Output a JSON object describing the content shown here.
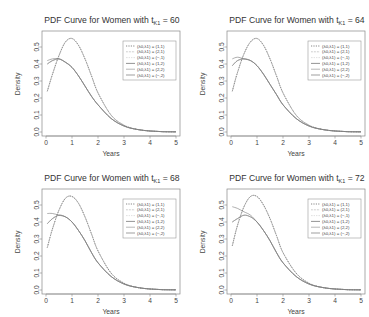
{
  "figure": {
    "panel_titles_prefix": "PDF Curve for Women with t",
    "panel_titles_subscript": "K1",
    "xlabel": "Years",
    "ylabel": "Density",
    "x_ticks": [
      "0",
      "1",
      "2",
      "3",
      "4",
      "5"
    ],
    "y_ticks": [
      "0.0",
      "0.1",
      "0.2",
      "0.3",
      "0.4",
      "0.5"
    ],
    "legend": [
      "(λ0,λ1) = (1,1)",
      "(λ0,λ1) = (2,1)",
      "(λ0,λ1) = (−,1)",
      "(λ0,λ1) = (1,2)",
      "(λ0,λ1) = (2,2)",
      "(λ0,λ1) = (−,2)"
    ]
  },
  "chart_data": [
    {
      "type": "line",
      "title": "PDF Curve for Women with tK1 = 60",
      "t_value": "60",
      "xlabel": "Years",
      "ylabel": "Density",
      "xlim": [
        0,
        5
      ],
      "ylim": [
        0,
        0.57
      ],
      "legend_position": "top-right",
      "x": [
        0.05,
        0.25,
        0.5,
        0.75,
        1.0,
        1.25,
        1.5,
        1.75,
        2.0,
        2.5,
        3.0,
        3.5,
        4.0,
        4.5,
        5.0
      ],
      "series": [
        {
          "name": "(λ0,λ1) = (1,1)",
          "values": [
            0.24,
            0.34,
            0.45,
            0.53,
            0.55,
            0.51,
            0.43,
            0.33,
            0.23,
            0.1,
            0.04,
            0.015,
            0.006,
            0.002,
            0.001
          ]
        },
        {
          "name": "(λ0,λ1) = (2,1)",
          "values": [
            0.24,
            0.34,
            0.45,
            0.53,
            0.55,
            0.51,
            0.43,
            0.33,
            0.23,
            0.1,
            0.04,
            0.015,
            0.006,
            0.002,
            0.001
          ]
        },
        {
          "name": "(λ0,λ1) = (−,1)",
          "values": [
            0.24,
            0.34,
            0.45,
            0.53,
            0.55,
            0.51,
            0.43,
            0.33,
            0.23,
            0.1,
            0.04,
            0.015,
            0.006,
            0.002,
            0.001
          ]
        },
        {
          "name": "(λ0,λ1) = (1,2)",
          "values": [
            0.4,
            0.42,
            0.43,
            0.41,
            0.38,
            0.33,
            0.27,
            0.21,
            0.16,
            0.08,
            0.035,
            0.015,
            0.006,
            0.002,
            0.001
          ]
        },
        {
          "name": "(λ0,λ1) = (2,2)",
          "values": [
            0.4,
            0.42,
            0.43,
            0.41,
            0.38,
            0.33,
            0.27,
            0.21,
            0.16,
            0.08,
            0.035,
            0.015,
            0.006,
            0.002,
            0.001
          ]
        },
        {
          "name": "(λ0,λ1) = (−,2)",
          "values": [
            0.42,
            0.43,
            0.43,
            0.41,
            0.38,
            0.33,
            0.27,
            0.21,
            0.16,
            0.08,
            0.035,
            0.015,
            0.006,
            0.002,
            0.001
          ]
        }
      ]
    },
    {
      "type": "line",
      "title": "PDF Curve for Women with tK1 = 64",
      "t_value": "64",
      "xlabel": "Years",
      "ylabel": "Density",
      "xlim": [
        0,
        5
      ],
      "ylim": [
        0,
        0.57
      ],
      "legend_position": "top-right",
      "x": [
        0.05,
        0.25,
        0.5,
        0.75,
        1.0,
        1.25,
        1.5,
        1.75,
        2.0,
        2.5,
        3.0,
        3.5,
        4.0,
        4.5,
        5.0
      ],
      "series": [
        {
          "name": "(λ0,λ1) = (1,1)",
          "values": [
            0.24,
            0.35,
            0.46,
            0.53,
            0.55,
            0.51,
            0.43,
            0.33,
            0.23,
            0.1,
            0.04,
            0.015,
            0.006,
            0.002,
            0.001
          ]
        },
        {
          "name": "(λ0,λ1) = (2,1)",
          "values": [
            0.24,
            0.35,
            0.46,
            0.53,
            0.55,
            0.51,
            0.43,
            0.33,
            0.23,
            0.1,
            0.04,
            0.015,
            0.006,
            0.002,
            0.001
          ]
        },
        {
          "name": "(λ0,λ1) = (−,1)",
          "values": [
            0.24,
            0.35,
            0.46,
            0.53,
            0.55,
            0.51,
            0.43,
            0.33,
            0.23,
            0.1,
            0.04,
            0.015,
            0.006,
            0.002,
            0.001
          ]
        },
        {
          "name": "(λ0,λ1) = (1,2)",
          "values": [
            0.39,
            0.42,
            0.43,
            0.42,
            0.39,
            0.34,
            0.28,
            0.22,
            0.16,
            0.08,
            0.035,
            0.015,
            0.006,
            0.002,
            0.001
          ]
        },
        {
          "name": "(λ0,λ1) = (2,2)",
          "values": [
            0.39,
            0.42,
            0.43,
            0.42,
            0.39,
            0.34,
            0.28,
            0.22,
            0.16,
            0.08,
            0.035,
            0.015,
            0.006,
            0.002,
            0.001
          ]
        },
        {
          "name": "(λ0,λ1) = (−,2)",
          "values": [
            0.43,
            0.44,
            0.43,
            0.42,
            0.39,
            0.34,
            0.28,
            0.22,
            0.16,
            0.08,
            0.035,
            0.015,
            0.006,
            0.002,
            0.001
          ]
        }
      ]
    },
    {
      "type": "line",
      "title": "PDF Curve for Women with tK1 = 68",
      "t_value": "68",
      "xlabel": "Years",
      "ylabel": "Density",
      "xlim": [
        0,
        5
      ],
      "ylim": [
        0,
        0.57
      ],
      "legend_position": "top-right",
      "x": [
        0.05,
        0.25,
        0.5,
        0.75,
        1.0,
        1.25,
        1.5,
        1.75,
        2.0,
        2.5,
        3.0,
        3.5,
        4.0,
        4.5,
        5.0
      ],
      "series": [
        {
          "name": "(λ0,λ1) = (1,1)",
          "values": [
            0.25,
            0.36,
            0.47,
            0.54,
            0.55,
            0.51,
            0.43,
            0.33,
            0.23,
            0.1,
            0.04,
            0.015,
            0.006,
            0.002,
            0.001
          ]
        },
        {
          "name": "(λ0,λ1) = (2,1)",
          "values": [
            0.25,
            0.36,
            0.47,
            0.54,
            0.55,
            0.51,
            0.43,
            0.33,
            0.23,
            0.1,
            0.04,
            0.015,
            0.006,
            0.002,
            0.001
          ]
        },
        {
          "name": "(λ0,λ1) = (−,1)",
          "values": [
            0.25,
            0.36,
            0.47,
            0.54,
            0.55,
            0.51,
            0.43,
            0.33,
            0.23,
            0.1,
            0.04,
            0.015,
            0.006,
            0.002,
            0.001
          ]
        },
        {
          "name": "(λ0,λ1) = (1,2)",
          "values": [
            0.39,
            0.42,
            0.44,
            0.43,
            0.4,
            0.35,
            0.29,
            0.22,
            0.16,
            0.08,
            0.035,
            0.015,
            0.006,
            0.002,
            0.001
          ]
        },
        {
          "name": "(λ0,λ1) = (2,2)",
          "values": [
            0.39,
            0.42,
            0.44,
            0.43,
            0.4,
            0.35,
            0.29,
            0.22,
            0.16,
            0.08,
            0.035,
            0.015,
            0.006,
            0.002,
            0.001
          ]
        },
        {
          "name": "(λ0,λ1) = (−,2)",
          "values": [
            0.45,
            0.45,
            0.44,
            0.43,
            0.4,
            0.35,
            0.29,
            0.22,
            0.16,
            0.08,
            0.035,
            0.015,
            0.006,
            0.002,
            0.001
          ]
        }
      ]
    },
    {
      "type": "line",
      "title": "PDF Curve for Women with tK1 = 72",
      "t_value": "72",
      "xlabel": "Years",
      "ylabel": "Density",
      "xlim": [
        0,
        5
      ],
      "ylim": [
        0,
        0.57
      ],
      "legend_position": "top-right",
      "x": [
        0.05,
        0.25,
        0.5,
        0.75,
        1.0,
        1.25,
        1.5,
        1.75,
        2.0,
        2.5,
        3.0,
        3.5,
        4.0,
        4.5,
        5.0
      ],
      "series": [
        {
          "name": "(λ0,λ1) = (1,1)",
          "values": [
            0.26,
            0.38,
            0.49,
            0.55,
            0.55,
            0.5,
            0.42,
            0.32,
            0.22,
            0.1,
            0.04,
            0.015,
            0.006,
            0.002,
            0.001
          ]
        },
        {
          "name": "(λ0,λ1) = (2,1)",
          "values": [
            0.26,
            0.38,
            0.49,
            0.55,
            0.55,
            0.5,
            0.42,
            0.32,
            0.22,
            0.1,
            0.04,
            0.015,
            0.006,
            0.002,
            0.001
          ]
        },
        {
          "name": "(λ0,λ1) = (−,1)",
          "values": [
            0.26,
            0.38,
            0.49,
            0.55,
            0.55,
            0.5,
            0.42,
            0.32,
            0.22,
            0.1,
            0.04,
            0.015,
            0.006,
            0.002,
            0.001
          ]
        },
        {
          "name": "(λ0,λ1) = (1,2)",
          "values": [
            0.4,
            0.42,
            0.44,
            0.43,
            0.4,
            0.35,
            0.29,
            0.22,
            0.16,
            0.08,
            0.035,
            0.015,
            0.006,
            0.002,
            0.001
          ]
        },
        {
          "name": "(λ0,λ1) = (2,2)",
          "values": [
            0.4,
            0.42,
            0.44,
            0.43,
            0.4,
            0.35,
            0.29,
            0.22,
            0.16,
            0.08,
            0.035,
            0.015,
            0.006,
            0.002,
            0.001
          ]
        },
        {
          "name": "(λ0,λ1) = (−,2)",
          "values": [
            0.49,
            0.48,
            0.46,
            0.44,
            0.4,
            0.35,
            0.29,
            0.22,
            0.16,
            0.08,
            0.035,
            0.015,
            0.006,
            0.002,
            0.001
          ]
        }
      ]
    }
  ]
}
